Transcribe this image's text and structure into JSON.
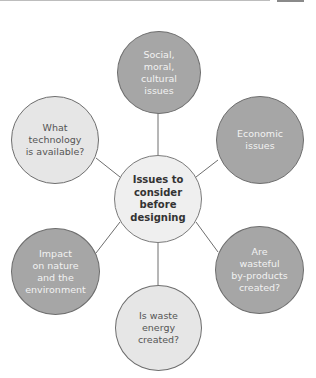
{
  "diagram": {
    "type": "mind-map",
    "colors": {
      "dark_node": "#a6a6a6",
      "light_node": "#e6e6e6",
      "center_node": "#efefef",
      "outline": "#6e6e6e"
    },
    "center": {
      "label": "Issues to\nconsider\nbefore\ndesigning"
    },
    "nodes": [
      {
        "id": "social",
        "label": "Social,\nmoral,\ncultural\nissues",
        "shade": "dark"
      },
      {
        "id": "economic",
        "label": "Economic\nissues",
        "shade": "dark"
      },
      {
        "id": "wasteful",
        "label": "Are\nwasteful\nby-products\ncreated?",
        "shade": "dark"
      },
      {
        "id": "energy",
        "label": "Is waste\nenergy\ncreated?",
        "shade": "light"
      },
      {
        "id": "impact",
        "label": "Impact\non nature\nand the\nenvironment",
        "shade": "dark"
      },
      {
        "id": "technology",
        "label": "What\ntechnology\nis available?",
        "shade": "light"
      }
    ]
  }
}
